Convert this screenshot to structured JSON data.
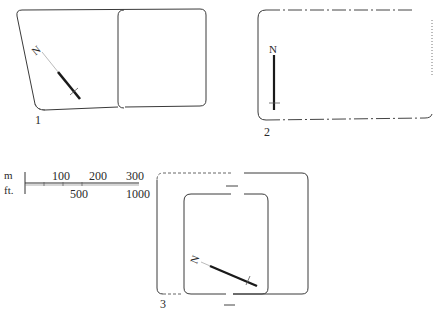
{
  "figures": [
    {
      "id": "fig-1",
      "label": "1",
      "north_label": "N",
      "north_direction": "northwest"
    },
    {
      "id": "fig-2",
      "label": "2",
      "north_label": "N",
      "north_direction": "north"
    },
    {
      "id": "fig-3",
      "label": "3",
      "north_label": "N",
      "north_direction": "west-northwest"
    }
  ],
  "scale_bar": {
    "metric_unit": "m",
    "imperial_unit": "ft.",
    "metric_ticks": [
      "100",
      "200",
      "300"
    ],
    "imperial_ticks": [
      "500",
      "1000"
    ]
  },
  "colors": {
    "line": "#3a3a3a",
    "background": "#ffffff",
    "text": "#2a2a2a"
  }
}
